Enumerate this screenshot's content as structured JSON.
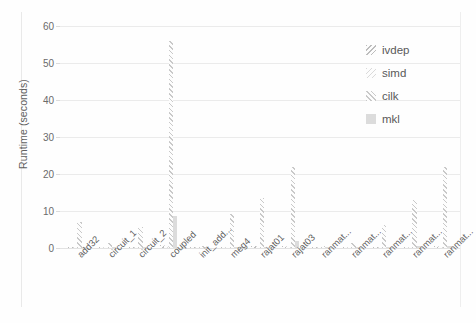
{
  "chart_data": {
    "type": "bar",
    "title": "",
    "xlabel": "",
    "ylabel": "Runtime (seconds)",
    "ylim": [
      0,
      60
    ],
    "yticks": [
      0,
      10,
      20,
      30,
      40,
      50,
      60
    ],
    "grid": true,
    "legend_position": "upper right",
    "categories": [
      "add32",
      "circuit_1",
      "circuit_2",
      "coupled",
      "init_add...",
      "meg4",
      "rajat01",
      "rajat03",
      "ranmat...",
      "ranmat...",
      "ranmat...",
      "ranmat...",
      "ranmat..."
    ],
    "series": [
      {
        "name": "ivdep",
        "pattern": "backslash-hatch",
        "color": "#bdbdbd",
        "values": [
          0.4,
          0.2,
          0.3,
          0.9,
          0.2,
          0.4,
          0.5,
          0.6,
          0.2,
          0.2,
          0.3,
          0.4,
          0.5
        ]
      },
      {
        "name": "simd",
        "pattern": "light-dots",
        "color": "#dadada",
        "values": [
          0.4,
          0.2,
          0.3,
          0.8,
          0.2,
          0.4,
          0.5,
          0.6,
          0.2,
          0.2,
          0.3,
          0.4,
          0.5
        ]
      },
      {
        "name": "cilk",
        "pattern": "forward-slash-hatch",
        "color": "#c9c9c9",
        "values": [
          7.0,
          1.3,
          5.6,
          56.0,
          0.5,
          9.2,
          13.5,
          22.0,
          0.6,
          1.3,
          6.2,
          13.0,
          22.0
        ]
      },
      {
        "name": "mkl",
        "pattern": "solid-fill",
        "color": "#dcdcdc",
        "values": [
          0.3,
          0.2,
          0.3,
          8.6,
          0.3,
          0.3,
          0.4,
          1.8,
          0.3,
          0.3,
          0.4,
          0.5,
          0.6
        ]
      }
    ]
  },
  "legend": {
    "items": [
      {
        "label": "ivdep",
        "swatch": "hatch-backslash-swatch"
      },
      {
        "label": "simd",
        "swatch": "dots-swatch"
      },
      {
        "label": "cilk",
        "swatch": "hatch-slash-swatch"
      },
      {
        "label": "mkl",
        "swatch": "solid-swatch"
      }
    ]
  }
}
